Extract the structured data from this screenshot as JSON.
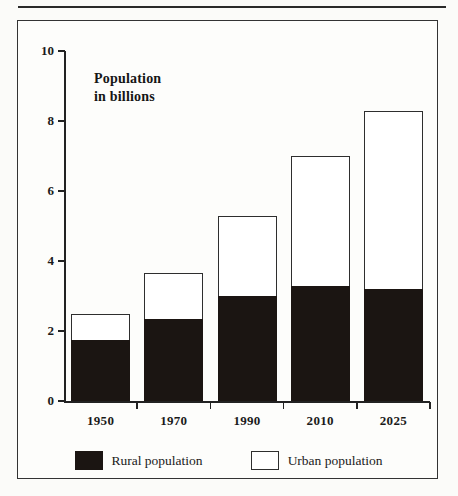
{
  "figure": {
    "title_line1": "Population",
    "title_line2": "in billions"
  },
  "chart_data": {
    "type": "bar",
    "subtype": "stacked-vertical",
    "title": "Population in billions",
    "xlabel": "",
    "ylabel": "Population in billions",
    "ylim": [
      0,
      10
    ],
    "yticks": [
      0,
      2,
      4,
      6,
      8,
      10
    ],
    "ytick_labels": [
      "0",
      "2",
      "4",
      "6",
      "8",
      "10"
    ],
    "grid": false,
    "legend_position": "bottom",
    "categories": [
      "1950",
      "1970",
      "1990",
      "2010",
      "2025"
    ],
    "series": [
      {
        "name": "Rural population",
        "color": "#1b1512",
        "values": [
          1.75,
          2.35,
          3.0,
          3.3,
          3.2
        ]
      },
      {
        "name": "Urban population",
        "color": "#ffffff",
        "values": [
          0.75,
          1.3,
          2.3,
          3.7,
          5.1
        ]
      }
    ],
    "totals": [
      2.5,
      3.65,
      5.3,
      7.0,
      8.3
    ]
  },
  "legend": {
    "items": [
      {
        "label": "Rural population",
        "swatch": "rural"
      },
      {
        "label": "Urban population",
        "swatch": "urban"
      }
    ]
  }
}
